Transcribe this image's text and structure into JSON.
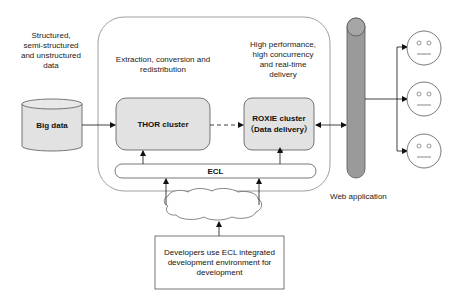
{
  "diagram": {
    "labels": {
      "source_data": "Structured,\nsemi-structured\nand unstructured\ndata",
      "extraction": "Extraction, conversion and\nredistribution",
      "performance": "High performance,\nhigh concurrency\nand real-time\ndelivery",
      "web_app": "Web application"
    },
    "nodes": {
      "big_data": "Big data",
      "thor": "THOR cluster",
      "roxie": "ROXIE cluster\n（Data delivery）",
      "ecl": "ECL",
      "developers": "Developers use ECL integrated\ndevelopment environment for\ndevelopment"
    },
    "users_count": 3,
    "colors": {
      "cluster_fill": "#e2e2e2",
      "tube_fill": "#9a9a9a",
      "stroke": "#555555",
      "container_stroke": "#777777"
    }
  }
}
